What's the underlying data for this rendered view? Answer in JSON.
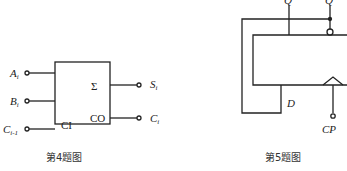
{
  "figure4": {
    "caption": "第4题图",
    "inputs": [
      {
        "label": "A",
        "sub": "i"
      },
      {
        "label": "B",
        "sub": "i"
      },
      {
        "label": "C",
        "sub": "i-1"
      }
    ],
    "outputs": [
      {
        "label": "S",
        "sub": "i"
      },
      {
        "label": "C",
        "sub": "i"
      }
    ],
    "box": {
      "sum_symbol": "Σ",
      "ci_label": "CI",
      "co_label": "CO"
    }
  },
  "figure5": {
    "caption": "第5题图",
    "q_label": "Q",
    "qbar_label": "Q",
    "d_label": "D",
    "cp_label": "CP"
  }
}
